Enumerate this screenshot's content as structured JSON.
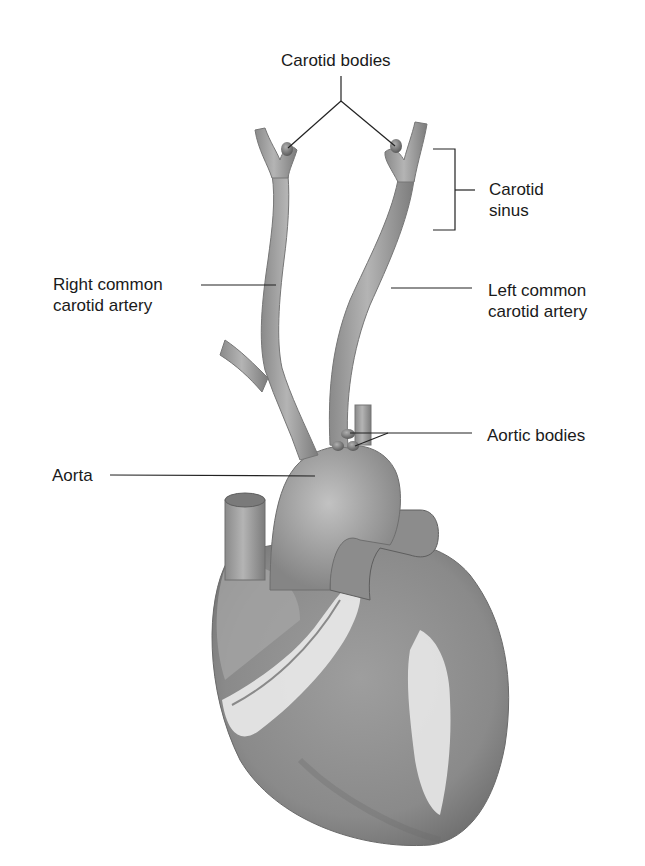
{
  "diagram": {
    "type": "anatomical-illustration",
    "labels": {
      "carotid_bodies": "Carotid bodies",
      "carotid_sinus_line1": "Carotid",
      "carotid_sinus_line2": "sinus",
      "right_common_carotid_line1": "Right common",
      "right_common_carotid_line2": "carotid artery",
      "left_common_carotid_line1": "Left common",
      "left_common_carotid_line2": "carotid artery",
      "aortic_bodies": "Aortic bodies",
      "aorta": "Aorta"
    },
    "colors": {
      "vessel": "#9a9a9a",
      "vessel_dark": "#6e6e6e",
      "vessel_light": "#c4c4c4",
      "body_node": "#7a7a7a",
      "fat": "#e8e8e8",
      "leader_line": "#222222",
      "background": "#ffffff"
    }
  }
}
